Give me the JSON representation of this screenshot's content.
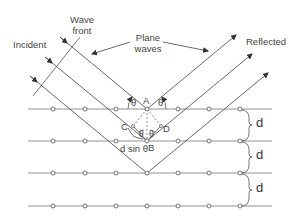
{
  "diagram": {
    "labels": {
      "incident": "Incident",
      "wave_front_line1": "Wave",
      "wave_front_line2": "front",
      "plane_waves_line1": "Plane",
      "plane_waves_line2": "waves",
      "reflected": "Reflected",
      "point_a": "A",
      "point_b": "B",
      "point_c": "C",
      "point_d": "D",
      "theta": "θ",
      "path_difference": "d sin θ",
      "spacing": "d"
    },
    "lattice": {
      "plane_count": 4,
      "plane_y": [
        109,
        141,
        173,
        206
      ],
      "atom_x": [
        53,
        85,
        116,
        147,
        178,
        209,
        240
      ],
      "plane_x_start": 28,
      "plane_x_end": 272
    },
    "colors": {
      "line": "#555555",
      "text": "#444444",
      "background": "#ffffff"
    }
  }
}
